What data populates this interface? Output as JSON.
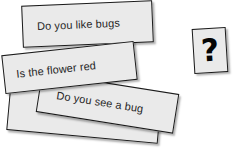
{
  "scene": {
    "background_color": "#ffffff",
    "card_fill_color": "#eaeaea",
    "card_border_color": "#1a1a1a",
    "text_color": "#262626"
  },
  "cards": [
    {
      "id": "blank",
      "label": "",
      "name": "question-card-blank"
    },
    {
      "id": "see-bug",
      "label": "Do you see a bug",
      "name": "question-card-see-bug"
    },
    {
      "id": "like-bugs",
      "label": "Do you like bugs",
      "name": "question-card-like-bugs"
    },
    {
      "id": "flower-red",
      "label": "Is the flower red",
      "name": "question-card-flower-red"
    }
  ],
  "question_card": {
    "glyph": "?",
    "name": "question-mark-card"
  }
}
